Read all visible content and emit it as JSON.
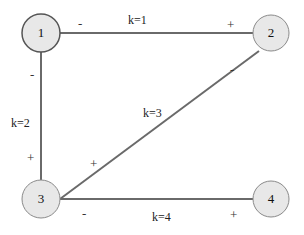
{
  "colors": {
    "edge": "#6a6a6a",
    "node_fill": "#e8e8e8",
    "node_stroke": "#8a8a8a",
    "node1_stroke": "#555555"
  },
  "nodes": [
    {
      "id": "1",
      "label": "1",
      "cx": 41,
      "cy": 33,
      "r": 19
    },
    {
      "id": "2",
      "label": "2",
      "cx": 271,
      "cy": 33,
      "r": 18
    },
    {
      "id": "3",
      "label": "3",
      "cx": 41,
      "cy": 199,
      "r": 19
    },
    {
      "id": "4",
      "label": "4",
      "cx": 271,
      "cy": 199,
      "r": 18
    }
  ],
  "edges": [
    {
      "from": "1",
      "to": "2",
      "label": "k=1",
      "sign_from": "-",
      "sign_to": "+"
    },
    {
      "from": "1",
      "to": "3",
      "label": "k=2",
      "sign_from": "-",
      "sign_to": "+"
    },
    {
      "from": "3",
      "to": "2",
      "label": "k=3",
      "sign_from": "+",
      "sign_to": "-"
    },
    {
      "from": "3",
      "to": "4",
      "label": "k=4",
      "sign_from": "-",
      "sign_to": "+"
    }
  ]
}
